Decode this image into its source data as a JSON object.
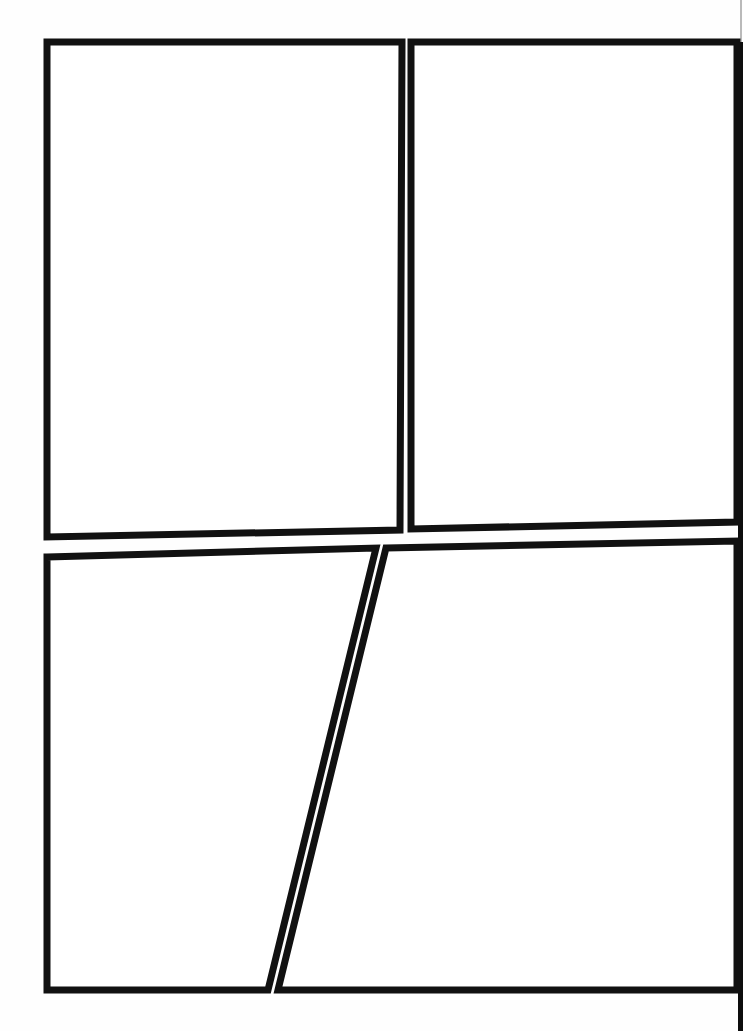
{
  "page": {
    "kind": "comic-panel-template",
    "width": 743,
    "height": 1031,
    "background": "#ffffff",
    "border_color": "#111111",
    "border_width": 7
  },
  "panels": [
    {
      "id": "panel-1",
      "position": "top-left",
      "points": "47,42 402,42 400,530 47,537",
      "content": ""
    },
    {
      "id": "panel-2",
      "position": "top-right",
      "points": "411,42 737,42 737,522 411,529",
      "content": ""
    },
    {
      "id": "panel-3",
      "position": "bottom-left",
      "points": "47,557 376,548 268,990 47,990",
      "content": ""
    },
    {
      "id": "panel-4",
      "position": "bottom-right",
      "points": "386,548 737,541 737,990 278,990",
      "content": ""
    }
  ],
  "right_edge": {
    "strip_color": "#0d0d0d",
    "strip_x": 738,
    "strip_top": 42
  }
}
